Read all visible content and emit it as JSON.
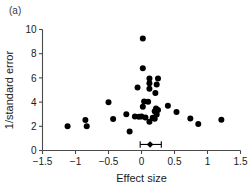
{
  "figure": {
    "panel_label": "(a)",
    "background_color": "#ffffff",
    "marker_color": "#000000",
    "axis_color": "#4a4a4a"
  },
  "chart_data": {
    "type": "scatter",
    "title": "",
    "subtitle": "",
    "xlabel": "Effect size",
    "ylabel": "1/standard error",
    "xlim": [
      -1.5,
      1.5
    ],
    "ylim": [
      0,
      10
    ],
    "xticks": [
      -1.5,
      -1,
      -0.5,
      0,
      0.5,
      1,
      1.5
    ],
    "xticklabels": [
      "−1.5",
      "−1",
      "−0.5",
      "0",
      "0.5",
      "1",
      "1.5"
    ],
    "yticks": [
      0,
      2,
      4,
      6,
      8,
      10
    ],
    "yticklabels": [
      "0",
      "2",
      "4",
      "6",
      "8",
      "10"
    ],
    "grid": false,
    "legend": null,
    "series": [
      {
        "name": "studies",
        "marker": "filled-circle",
        "color": "#000000",
        "points": [
          {
            "x": 0.02,
            "y": 9.25
          },
          {
            "x": 0.02,
            "y": 6.8
          },
          {
            "x": 0.12,
            "y": 5.95
          },
          {
            "x": 0.25,
            "y": 5.95
          },
          {
            "x": 0.12,
            "y": 5.55
          },
          {
            "x": 0.23,
            "y": 5.45
          },
          {
            "x": -0.06,
            "y": 5.2
          },
          {
            "x": 0.12,
            "y": 5.1
          },
          {
            "x": 0.21,
            "y": 4.75
          },
          {
            "x": -0.5,
            "y": 3.98
          },
          {
            "x": 0.04,
            "y": 4.05
          },
          {
            "x": 0.1,
            "y": 4.02
          },
          {
            "x": 0.02,
            "y": 3.62
          },
          {
            "x": 0.4,
            "y": 3.7
          },
          {
            "x": 0.22,
            "y": 3.48
          },
          {
            "x": 0.25,
            "y": 3.35
          },
          {
            "x": 0.2,
            "y": 3.25
          },
          {
            "x": 0.53,
            "y": 3.18
          },
          {
            "x": -0.23,
            "y": 3.0
          },
          {
            "x": 0.23,
            "y": 2.98
          },
          {
            "x": -0.1,
            "y": 2.82
          },
          {
            "x": -0.04,
            "y": 2.78
          },
          {
            "x": 0.0,
            "y": 2.8
          },
          {
            "x": 0.06,
            "y": 2.72
          },
          {
            "x": 0.17,
            "y": 2.7
          },
          {
            "x": 0.2,
            "y": 2.62
          },
          {
            "x": -0.43,
            "y": 2.6
          },
          {
            "x": 0.74,
            "y": 2.65
          },
          {
            "x": -0.85,
            "y": 2.52
          },
          {
            "x": 1.21,
            "y": 2.55
          },
          {
            "x": 0.12,
            "y": 2.38
          },
          {
            "x": 0.86,
            "y": 2.18
          },
          {
            "x": -1.12,
            "y": 2.0
          },
          {
            "x": -0.83,
            "y": 2.0
          },
          {
            "x": -0.18,
            "y": 1.58
          }
        ]
      }
    ],
    "summary_estimate": {
      "name": "pooled-effect",
      "x": 0.13,
      "y": 0.5,
      "ci_low": -0.02,
      "ci_high": 0.3,
      "marker": "filled-diamond"
    }
  }
}
